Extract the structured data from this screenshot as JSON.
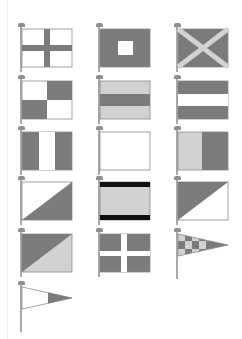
{
  "colors": {
    "dark": "#7b7b7b",
    "light": "#d2d2d2",
    "white": "#ffffff",
    "black": "#111111",
    "border": "#8a8a8a",
    "pole": "#a9a9a9"
  },
  "layout": {
    "columns": 3,
    "rows": 6
  },
  "flags": [
    {
      "row": 1,
      "col": 1,
      "pattern": "white field with dark cross"
    },
    {
      "row": 1,
      "col": 2,
      "pattern": "dark field with white square center"
    },
    {
      "row": 1,
      "col": 3,
      "pattern": "dark field with light saltire"
    },
    {
      "row": 2,
      "col": 1,
      "pattern": "quartered white and dark"
    },
    {
      "row": 2,
      "col": 2,
      "pattern": "light-dark-light horizontal stripes"
    },
    {
      "row": 2,
      "col": 3,
      "pattern": "dark-white-dark horizontal stripes"
    },
    {
      "row": 3,
      "col": 1,
      "pattern": "dark-white-dark vertical stripes"
    },
    {
      "row": 3,
      "col": 2,
      "pattern": "plain white"
    },
    {
      "row": 3,
      "col": 3,
      "pattern": "light hoist, dark fly vertical halves"
    },
    {
      "row": 4,
      "col": 1,
      "pattern": "diagonal white upper-left, dark lower-right"
    },
    {
      "row": 4,
      "col": 2,
      "pattern": "black-light-black horizontal bands"
    },
    {
      "row": 4,
      "col": 3,
      "pattern": "diagonal dark upper-left, white lower-right"
    },
    {
      "row": 5,
      "col": 1,
      "pattern": "diagonal dark upper-left, light lower-right"
    },
    {
      "row": 5,
      "col": 2,
      "pattern": "dark field with white cross"
    },
    {
      "row": 5,
      "col": 3,
      "pattern": "checkered pennant light and dark"
    },
    {
      "row": 6,
      "col": 1,
      "pattern": "pennant white hoist, dark tip"
    }
  ]
}
